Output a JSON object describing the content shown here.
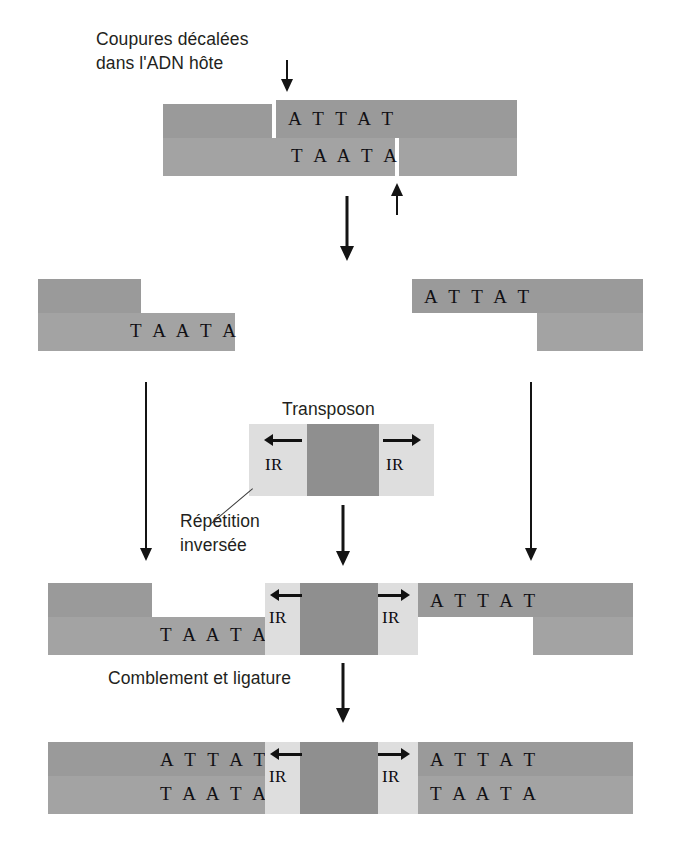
{
  "diagram": {
    "labels": {
      "staggered_cuts": "Coupures décalées\ndans l'ADN hôte",
      "staggered_cuts_line1": "Coupures décalées",
      "staggered_cuts_line2": "dans l'ADN hôte",
      "transposon": "Transposon",
      "inverted_repeat_line1": "Répétition",
      "inverted_repeat_line2": "inversée",
      "fill_and_ligate": "Comblement et ligature"
    },
    "sequences": {
      "top_strand": "A T T A T",
      "bottom_strand": "T A A T A"
    },
    "ir_label": "IR",
    "colors": {
      "dna_top": "#9a9a9a",
      "dna_bottom": "#a3a3a3",
      "inverted_repeat": "#dedede",
      "transposon_core": "#8f8f8f",
      "text": "#231f20",
      "arrow": "#141414",
      "background": "#ffffff"
    },
    "steps": [
      {
        "id": "step-1-host-dna",
        "name": "Host DNA with staggered cuts",
        "top_sequence": "A T T A T",
        "bottom_sequence": "T A A T A"
      },
      {
        "id": "step-2-cut-fragments",
        "name": "Separated host DNA fragments",
        "left_fragment_sequence": "T A A T A",
        "right_fragment_sequence": "A T T A T"
      },
      {
        "id": "step-3-transposon",
        "name": "Transposon with inverted repeats",
        "left_ir": "IR",
        "right_ir": "IR",
        "caption": "Transposon"
      },
      {
        "id": "step-4-inserted",
        "name": "Transposon inserted between fragments",
        "left_bottom_sequence": "T A A T A",
        "left_ir": "IR",
        "right_ir": "IR",
        "right_top_sequence": "A T T A T"
      },
      {
        "id": "step-5-ligated",
        "name": "Gaps filled and ligated, target site duplicated",
        "left_top_sequence": "A T T A T",
        "left_bottom_sequence": "T A A T A",
        "left_ir": "IR",
        "right_ir": "IR",
        "right_top_sequence": "A T T A T",
        "right_bottom_sequence": "T A A T A"
      }
    ]
  }
}
